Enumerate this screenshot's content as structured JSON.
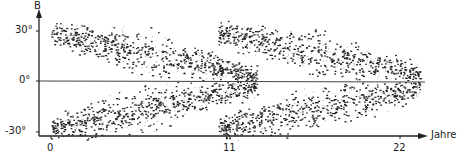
{
  "chart_data": {
    "type": "scatter",
    "title": "",
    "xlabel": "Jahre",
    "ylabel": "B",
    "x_ticks": [
      "0",
      "11",
      "22"
    ],
    "y_ticks": [
      "30°",
      "0°",
      "-30°"
    ],
    "xlim": [
      -0.8,
      23.5
    ],
    "ylim": [
      -33,
      38
    ],
    "grid": false,
    "legend": null,
    "reference_line": {
      "y": 0,
      "label": "0°"
    },
    "series": [
      {
        "name": "cycle 1",
        "x_range": [
          0,
          13
        ],
        "lat_start": 28,
        "lat_end": 3,
        "hemispheres": [
          "north",
          "south"
        ]
      },
      {
        "name": "cycle 2",
        "x_range": [
          10.5,
          24
        ],
        "lat_start": 28,
        "lat_end": 3,
        "hemispheres": [
          "north",
          "south"
        ]
      }
    ]
  },
  "labels": {
    "y_axis": "B",
    "x_axis": "Jahre",
    "y30": "30°",
    "y0": "0°",
    "ym30": "-30°",
    "x0": "0",
    "x11": "11",
    "x22": "22"
  }
}
